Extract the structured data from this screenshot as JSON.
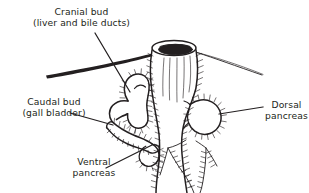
{
  "figure": {
    "style": "line-drawing",
    "ink_color": "#231f20",
    "background_color": "#ffffff",
    "labels": [
      {
        "id": "cranial-bud",
        "line1": "Cranial bud",
        "line2": "(liver and bile ducts)",
        "align": "center"
      },
      {
        "id": "caudal-bud",
        "line1": "Caudal bud",
        "line2": "(gall bladder)",
        "align": "center"
      },
      {
        "id": "dorsal-pancreas",
        "line1": "Dorsal",
        "line2": "pancreas",
        "align": "center"
      },
      {
        "id": "ventral-pancreas",
        "line1": "Ventral",
        "line2": "pancreas",
        "align": "center"
      }
    ],
    "structures": [
      "duodenum-tube",
      "cranial-bud-shape",
      "caudal-bud-shape",
      "ventral-pancreas-shape",
      "dorsal-pancreas-shape",
      "mesentery-band"
    ]
  }
}
